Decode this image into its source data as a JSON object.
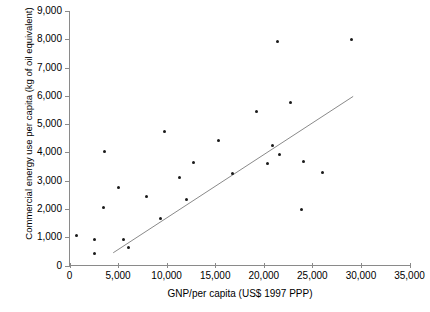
{
  "chart_data": {
    "type": "scatter",
    "title": "",
    "xlabel": "GNP/per capita (US$ 1997 PPP)",
    "ylabel": "Commercial energy use per capita (kg of oil equivalent)",
    "xlim": [
      0,
      35000
    ],
    "ylim": [
      0,
      9000
    ],
    "xticks": [
      "0",
      "5,000",
      "10,000",
      "15,000",
      "20,000",
      "25,000",
      "30,000",
      "35,000"
    ],
    "xtick_values": [
      0,
      5000,
      10000,
      15000,
      20000,
      25000,
      30000,
      35000
    ],
    "yticks": [
      "0",
      "1,000",
      "2,000",
      "3,000",
      "4,000",
      "5,000",
      "6,000",
      "7,000",
      "8,000",
      "9,000"
    ],
    "ytick_values": [
      0,
      1000,
      2000,
      3000,
      4000,
      5000,
      6000,
      7000,
      8000,
      9000
    ],
    "grid": false,
    "legend": false,
    "marker_color": "#1a1a1a",
    "trend_line": {
      "color": "#8a8a8a",
      "x0": 4500,
      "y0": 450,
      "x1": 29200,
      "y1": 5980
    },
    "points": [
      {
        "label": "United States",
        "x": 29000,
        "y": 8000,
        "lx": -5,
        "ly": -4,
        "align": "left"
      },
      {
        "label": "Canada",
        "x": 21400,
        "y": 7930,
        "lx": -5,
        "ly": -4,
        "align": "left"
      },
      {
        "label": "Belgium",
        "x": 22700,
        "y": 5750,
        "lx": 0,
        "ly": -11,
        "align": "center"
      },
      {
        "label": "Australia",
        "x": 19200,
        "y": 5460,
        "lx": -5,
        "ly": -4,
        "align": "left"
      },
      {
        "label": "Saudi Arabia",
        "x": 9800,
        "y": 4750,
        "lx": -5,
        "ly": -4,
        "align": "left"
      },
      {
        "label": "New Zealand",
        "x": 15300,
        "y": 4430,
        "lx": -5,
        "ly": -4,
        "align": "left"
      },
      {
        "label": "Germany",
        "x": 20900,
        "y": 4250,
        "lx": -5,
        "ly": -4,
        "align": "left"
      },
      {
        "label": "Russian Federation",
        "x": 3600,
        "y": 4040,
        "lx": -5,
        "ly": -9,
        "align": "left"
      },
      {
        "label": "France",
        "x": 21600,
        "y": 3920,
        "lx": 3,
        "ly": -9,
        "align": "right"
      },
      {
        "label": "Japan",
        "x": 24100,
        "y": 3680,
        "lx": 3,
        "ly": -4,
        "align": "right"
      },
      {
        "label": "United Kingdom",
        "x": 20350,
        "y": 3620,
        "lx": 3,
        "ly": -4,
        "align": "right"
      },
      {
        "label": "Switzerland",
        "x": 26050,
        "y": 3290,
        "lx": 3,
        "ly": -4,
        "align": "right"
      },
      {
        "label": "Korea",
        "x": 12800,
        "y": 3650,
        "lx": -5,
        "ly": -4,
        "align": "left"
      },
      {
        "label": "Ireland",
        "x": 16750,
        "y": 3270,
        "lx": 3,
        "ly": -4,
        "align": "right"
      },
      {
        "label": "Slovenia",
        "x": 11350,
        "y": 3120,
        "lx": -5,
        "ly": -4,
        "align": "left"
      },
      {
        "label": "Bulgaria",
        "x": 5050,
        "y": 2770,
        "lx": -5,
        "ly": -4,
        "align": "left"
      },
      {
        "label": "Venezuela",
        "x": 7950,
        "y": 2450,
        "lx": -5,
        "ly": -4,
        "align": "left"
      },
      {
        "label": "Greece",
        "x": 12050,
        "y": 2340,
        "lx": 3,
        "ly": -4,
        "align": "right"
      },
      {
        "label": "Romania",
        "x": 3500,
        "y": 2060,
        "lx": -5,
        "ly": -4,
        "align": "left"
      },
      {
        "label": "Argentina",
        "x": 9400,
        "y": 1670,
        "lx": 3,
        "ly": -4,
        "align": "right"
      },
      {
        "label": "Hong Kong",
        "x": 23850,
        "y": 1990,
        "lx": 3,
        "ly": -4,
        "align": "right"
      },
      {
        "label": "Moldova",
        "x": 700,
        "y": 1050,
        "lx": -3,
        "ly": -10,
        "align": "left"
      },
      {
        "label": "China",
        "x": 2550,
        "y": 910,
        "lx": 3,
        "ly": -1,
        "align": "right"
      },
      {
        "label": "Brazil",
        "x": 5550,
        "y": 930,
        "lx": 3,
        "ly": -4,
        "align": "right"
      },
      {
        "label": "Costa Rica",
        "x": 6100,
        "y": 640,
        "lx": 3,
        "ly": -3,
        "align": "right"
      },
      {
        "label": "Morocco",
        "x": 2560,
        "y": 420,
        "lx": 3,
        "ly": -2,
        "align": "right"
      }
    ]
  }
}
